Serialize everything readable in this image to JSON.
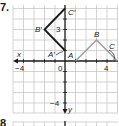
{
  "problem": {
    "number": "7.",
    "next_number": "8"
  },
  "graph": {
    "x_axis_label": "x",
    "y_axis_label": "y",
    "origin_label": "0",
    "tick_labels": {
      "x_neg": "−4",
      "x_pos": "4",
      "y_pos": "3",
      "y_neg": "−4"
    },
    "colors": {
      "grid": "#c8c8c8",
      "axis": "#1a1a1a",
      "original_figure": "#9a9a9a",
      "image_figure": "#1a1a1a"
    },
    "original_figure": {
      "points": [
        {
          "label": "A",
          "x": 1,
          "y": 0
        },
        {
          "label": "B",
          "x": 3,
          "y": 2
        },
        {
          "label": "C",
          "x": 5,
          "y": 0
        }
      ]
    },
    "image_figure": {
      "points": [
        {
          "label": "A′",
          "x": 0,
          "y": 1
        },
        {
          "label": "B′",
          "x": -2,
          "y": 3
        },
        {
          "label": "C′",
          "x": 0,
          "y": 5
        }
      ]
    }
  }
}
